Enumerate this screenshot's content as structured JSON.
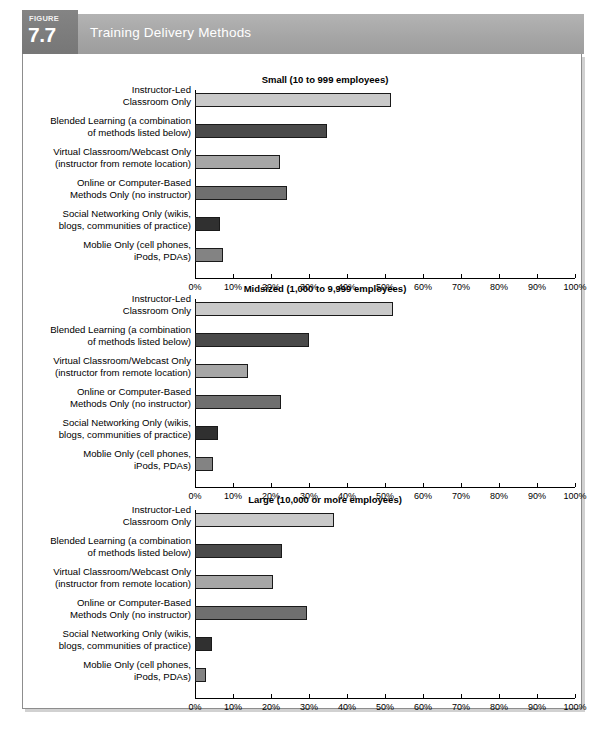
{
  "figure": {
    "badge_word": "FIGURE",
    "badge_number": "7.7",
    "title": "Training Delivery Methods"
  },
  "chart_data": [
    {
      "type": "bar",
      "orientation": "horizontal",
      "title": "Small (10 to 999 employees)",
      "categories": [
        "Instructor-Led\nClassroom Only",
        "Blended Learning (a combination\nof methods listed below)",
        "Virtual Classroom/Webcast Only\n(instructor from remote location)",
        "Online or Computer-Based\nMethods Only (no instructor)",
        "Social Networking Only (wikis,\nblogs, communities of practice)",
        "Moblie Only (cell phones,\niPods, PDAs)"
      ],
      "values": [
        51.5,
        34.8,
        22.3,
        24.3,
        6.5,
        7.3
      ],
      "xlabel": "",
      "ylabel": "",
      "xlim": [
        0,
        100
      ],
      "xticks": [
        0,
        10,
        20,
        30,
        40,
        50,
        60,
        70,
        80,
        90,
        100
      ],
      "xticklabels": [
        "0%",
        "10%",
        "20%",
        "30%",
        "40%",
        "50%",
        "60%",
        "70%",
        "80%",
        "90%",
        "100%"
      ],
      "grid": false,
      "legend": "none"
    },
    {
      "type": "bar",
      "orientation": "horizontal",
      "title": "Midsized (1,000 to 9,999 employees)",
      "categories": [
        "Instructor-Led\nClassroom Only",
        "Blended Learning (a combination\nof methods listed below)",
        "Virtual Classroom/Webcast Only\n(instructor from remote location)",
        "Online or Computer-Based\nMethods Only (no instructor)",
        "Social Networking Only (wikis,\nblogs, communities of practice)",
        "Moblie Only (cell phones,\niPods, PDAs)"
      ],
      "values": [
        52.0,
        30.0,
        14.0,
        22.5,
        6.0,
        4.8
      ],
      "xlabel": "",
      "ylabel": "",
      "xlim": [
        0,
        100
      ],
      "xticks": [
        0,
        10,
        20,
        30,
        40,
        50,
        60,
        70,
        80,
        90,
        100
      ],
      "xticklabels": [
        "0%",
        "10%",
        "20%",
        "30%",
        "40%",
        "50%",
        "60%",
        "70%",
        "80%",
        "90%",
        "100%"
      ],
      "grid": false,
      "legend": "none"
    },
    {
      "type": "bar",
      "orientation": "horizontal",
      "title": "Large (10,000 or more employees)",
      "categories": [
        "Instructor-Led\nClassroom Only",
        "Blended Learning (a combination\nof methods listed below)",
        "Virtual Classroom/Webcast Only\n(instructor from remote location)",
        "Online or Computer-Based\nMethods Only (no instructor)",
        "Social Networking Only (wikis,\nblogs, communities of practice)",
        "Moblie Only (cell phones,\niPods, PDAs)"
      ],
      "values": [
        36.5,
        23.0,
        20.5,
        29.5,
        4.5,
        3.0
      ],
      "xlabel": "",
      "ylabel": "",
      "xlim": [
        0,
        100
      ],
      "xticks": [
        0,
        10,
        20,
        30,
        40,
        50,
        60,
        70,
        80,
        90,
        100
      ],
      "xticklabels": [
        "0%",
        "10%",
        "20%",
        "30%",
        "40%",
        "50%",
        "60%",
        "70%",
        "80%",
        "90%",
        "100%"
      ],
      "grid": false,
      "legend": "none"
    }
  ],
  "colors": {
    "bar_instructor_led": "#c9c9c9",
    "bar_blended": "#4a4a4a",
    "bar_virtual": "#a6a6a6",
    "bar_online": "#6f6f6f",
    "bar_social": "#303030",
    "bar_mobile": "#838383",
    "header_band": "#a6a6a6",
    "header_badge": "#7c7c7c",
    "panel_border": "#8d8d8d",
    "axis": "#000000"
  }
}
